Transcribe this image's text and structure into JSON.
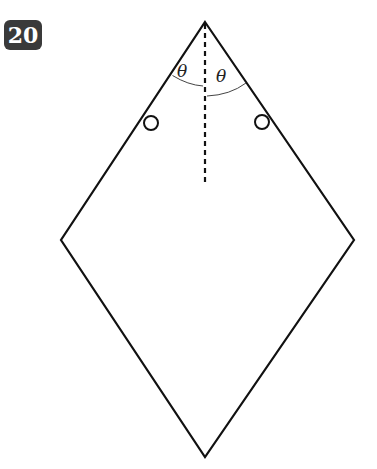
{
  "problem": {
    "number": "20"
  },
  "diagram": {
    "type": "rhombus-with-pivots",
    "labels": {
      "angle_left": "θ",
      "angle_right": "θ"
    },
    "colors": {
      "stroke": "#111111",
      "badge_bg": "#3a3a3a",
      "badge_text": "#ffffff"
    }
  }
}
